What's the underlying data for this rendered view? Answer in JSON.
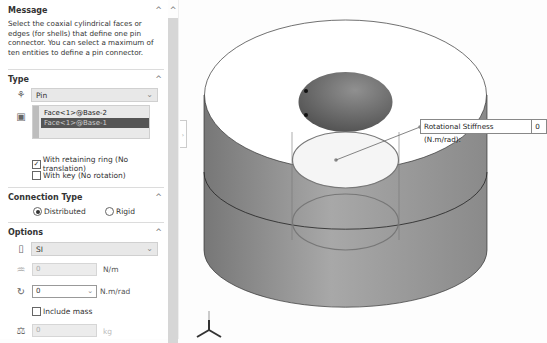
{
  "panel": {
    "message": {
      "title": "Message",
      "text": "Select the coaxial cylindrical faces or edges (for shells) that define one pin connector. You can select a maximum of ten entities to define a pin connector."
    },
    "type": {
      "title": "Type",
      "connector_type": "Pin",
      "selection_list": [
        "Face<1>@Base-2",
        "Face<1>@Base-1"
      ],
      "selected_index": 1,
      "with_retaining_ring": {
        "label": "With retaining ring (No translation)",
        "checked": true
      },
      "with_key": {
        "label": "With key (No rotation)",
        "checked": false
      }
    },
    "connection_type": {
      "title": "Connection Type",
      "options": [
        "Distributed",
        "Rigid"
      ],
      "selected": "Distributed"
    },
    "options": {
      "title": "Options",
      "unit_system": "SI",
      "axial_stiffness": {
        "value": "0",
        "unit": "N/m"
      },
      "rotational_stiffness": {
        "value": "0",
        "unit": "N.m/rad"
      },
      "include_mass": {
        "label": "Include mass",
        "checked": false
      },
      "mass": {
        "value": "0",
        "unit": "kg"
      }
    }
  },
  "viewport": {
    "callout": {
      "label": "Rotational Stiffness (N.m/rad):",
      "value": "0"
    },
    "triad_axis": "Y"
  },
  "glyphs": {
    "caret_up": "^",
    "chevron_down": "⌄",
    "check": "✓"
  }
}
